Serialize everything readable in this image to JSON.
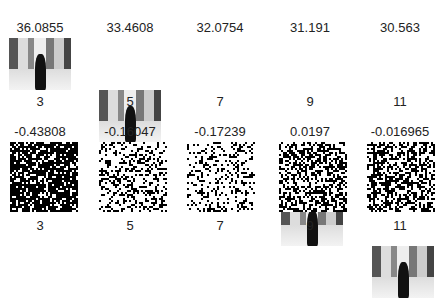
{
  "top_row": {
    "values": [
      "36.0855",
      "33.4608",
      "32.0754",
      "31.191",
      "30.563"
    ],
    "labels": [
      "3",
      "5",
      "7",
      "9",
      "11"
    ],
    "image_type": "grayscale photo thumbnail"
  },
  "bottom_row": {
    "values": [
      "-0.43808",
      "-0.16047",
      "-0.17239",
      "0.0197",
      "-0.016965"
    ],
    "labels": [
      "3",
      "5",
      "7",
      "9",
      "11"
    ],
    "image_type": "binary noise pattern",
    "densities": [
      0.75,
      0.35,
      0.25,
      0.5,
      0.5
    ]
  }
}
